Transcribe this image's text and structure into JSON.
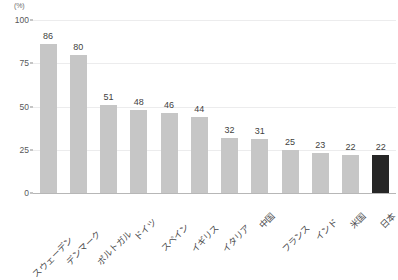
{
  "chart_data": {
    "type": "bar",
    "title": "",
    "subtitle": "",
    "xlabel": "",
    "ylabel": "",
    "unit_label": "(%)",
    "ylim": [
      0,
      100
    ],
    "yticks": [
      0,
      25,
      50,
      75,
      100
    ],
    "ytick_labels": [
      "0",
      "25",
      "50",
      "75",
      "100"
    ],
    "grid": true,
    "legend": "none",
    "categories": [
      "スウェーデン",
      "デンマーク",
      "ポルトガル",
      "ドイツ",
      "スペイン",
      "イギリス",
      "イタリア",
      "中国",
      "フランス",
      "インド",
      "米国",
      "日本"
    ],
    "values": [
      86,
      80,
      51,
      48,
      46,
      44,
      32,
      31,
      25,
      23,
      22,
      22
    ],
    "value_labels": [
      "86",
      "80",
      "51",
      "48",
      "46",
      "44",
      "32",
      "31",
      "25",
      "23",
      "22",
      "22"
    ],
    "highlight_index": 11,
    "colors": {
      "bar": "#c6c6c6",
      "bar_highlight": "#262626",
      "gridline": "#ececed",
      "baseline": "#b7b7b7",
      "tick_text": "#58585a",
      "value_text": "#3f3f41",
      "category_text": "#4a4a4c",
      "unit_text": "#6d6d6d",
      "background": "#ffffff"
    }
  }
}
